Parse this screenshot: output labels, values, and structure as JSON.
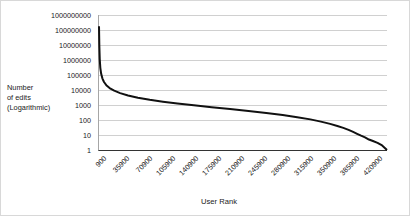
{
  "chart_data": {
    "type": "line",
    "title": "",
    "xlabel": "User Rank",
    "ylabel": "Number of edits (Logarithmic)",
    "ylabel_lines": [
      "Number",
      "of edits",
      "(Logarithmic)"
    ],
    "yscale": "log",
    "ylim": [
      1,
      1000000000
    ],
    "xlim": [
      900,
      438400
    ],
    "grid": true,
    "legend": "none",
    "series_color": "#111111",
    "grid_color": "#d0d0d0",
    "axis_color": "#333333",
    "ytick_labels": [
      "1000000000",
      "100000000",
      "10000000",
      "1000000",
      "100000",
      "10000",
      "1000",
      "100",
      "10",
      "1"
    ],
    "ytick_values": [
      1000000000,
      100000000,
      10000000,
      1000000,
      100000,
      10000,
      1000,
      100,
      10,
      1
    ],
    "xtick_labels": [
      "900",
      "35900",
      "70900",
      "105900",
      "140900",
      "175900",
      "210900",
      "245900",
      "280900",
      "315900",
      "350900",
      "385900",
      "420900"
    ],
    "xtick_values": [
      900,
      35900,
      70900,
      105900,
      140900,
      175900,
      210900,
      245900,
      280900,
      315900,
      350900,
      385900,
      420900
    ],
    "series": [
      {
        "name": "Number of edits",
        "x": [
          900,
          1400,
          2000,
          2900,
          4200,
          6000,
          8500,
          12000,
          17000,
          24000,
          33000,
          45000,
          60000,
          78000,
          98000,
          120000,
          145000,
          172000,
          200000,
          228000,
          255000,
          280000,
          302000,
          322000,
          338000,
          352000,
          363000,
          372000,
          380000,
          387000,
          393000,
          399000,
          405000,
          411000,
          417000,
          424000,
          431000,
          438400
        ],
        "y": [
          180000000,
          9000000,
          1200000,
          300000,
          120000,
          60000,
          34000,
          21000,
          13500,
          9000,
          6200,
          4300,
          3000,
          2200,
          1650,
          1250,
          950,
          720,
          540,
          400,
          295,
          215,
          155,
          110,
          78,
          55,
          40,
          30,
          22,
          16,
          12,
          9,
          7,
          5,
          4,
          3,
          2,
          1
        ]
      }
    ]
  }
}
